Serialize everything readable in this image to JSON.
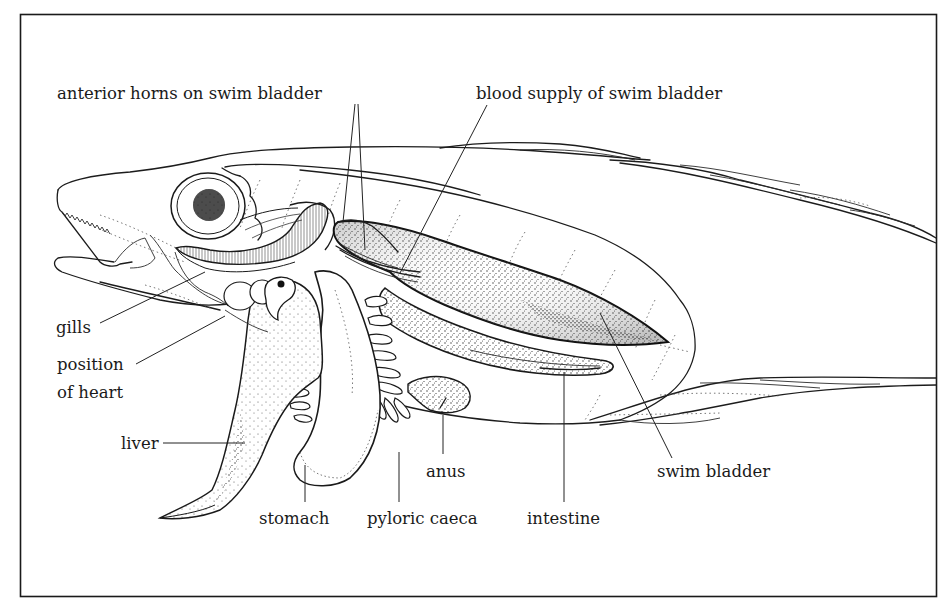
{
  "figure": {
    "frame": {
      "x": 20,
      "y": 14,
      "width": 917,
      "height": 583,
      "border_color": "#1a1a1a"
    },
    "colors": {
      "background": "#ffffff",
      "ink": "#1a1a1a",
      "stipple": "#3a3a3a"
    }
  },
  "labels": {
    "anterior_horns": "anterior horns on swim bladder",
    "blood_supply": "blood supply of swim bladder",
    "gills": "gills",
    "position_of_heart_line1": "position",
    "position_of_heart_line2": "of heart",
    "liver": "liver",
    "stomach": "stomach",
    "pyloric_caeca": "pyloric caeca",
    "anus": "anus",
    "intestine": "intestine",
    "swim_bladder": "swim bladder"
  }
}
